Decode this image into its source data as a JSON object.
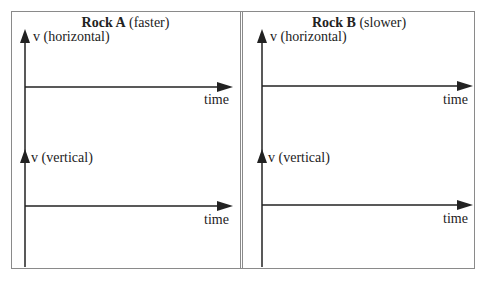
{
  "panels": [
    {
      "id": "rock-a",
      "title_bold": "Rock A",
      "title_rest": " (faster)",
      "graphs": [
        {
          "y_label": "v (horizontal)",
          "x_label": "time"
        },
        {
          "y_label": "v (vertical)",
          "x_label": "time"
        }
      ]
    },
    {
      "id": "rock-b",
      "title_bold": "Rock B",
      "title_rest": " (slower)",
      "graphs": [
        {
          "y_label": "v (horizontal)",
          "x_label": "time"
        },
        {
          "y_label": "v (vertical)",
          "x_label": "time"
        }
      ]
    }
  ],
  "colors": {
    "axis": "#222222",
    "border": "#8a8a8a",
    "background": "#ffffff"
  }
}
